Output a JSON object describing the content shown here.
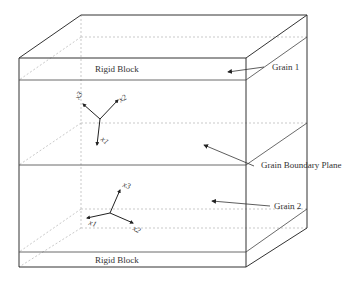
{
  "diagram": {
    "type": "bicrystal schematic",
    "labels": {
      "top_block": "Rigid Block",
      "bottom_block": "Rigid Block",
      "grain1": "Grain 1",
      "grain2": "Grain 2",
      "boundary": "Grain Boundary Plane"
    },
    "grain1_axes": {
      "a": "x3",
      "b": "x2",
      "c": "x1"
    },
    "grain2_axes": {
      "a": "x3",
      "b": "x1",
      "c": "x2"
    },
    "colors": {
      "line": "#333333",
      "hidden": "#bbbbbb",
      "background": "#ffffff"
    }
  }
}
